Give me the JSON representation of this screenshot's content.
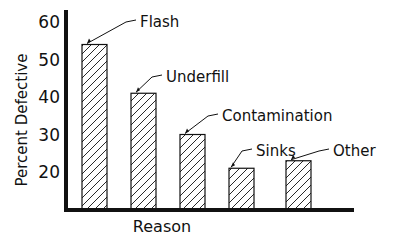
{
  "chart_data": {
    "type": "bar",
    "title": "",
    "xlabel": "Reason",
    "ylabel": "Percent Defective",
    "categories": [
      "Flash",
      "Underfill",
      "Contamination",
      "Sinks",
      "Other"
    ],
    "values": [
      54,
      41,
      30,
      21,
      23
    ],
    "yticks": [
      20,
      30,
      40,
      50,
      60
    ],
    "ylim": [
      10,
      62
    ],
    "grid": false,
    "legend": false,
    "bar_fill": "diagonal-hatch",
    "annotations": "category labels placed above each bar with leader lines"
  },
  "colors": {
    "ink": "#111111",
    "background": "#ffffff"
  }
}
